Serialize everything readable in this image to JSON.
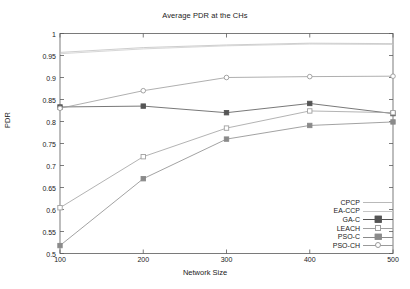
{
  "figure": {
    "title": "Average PDR at the CHs",
    "xlabel": "Network Size",
    "ylabel": "PDR"
  },
  "axes": {
    "y_ticks": [
      "1",
      "0.95",
      "0.9",
      "0.85",
      "0.8",
      "0.75",
      "0.7",
      "0.65",
      "0.6",
      "0.55",
      "0.5"
    ],
    "x_ticks": [
      "100",
      "200",
      "300",
      "400",
      "500"
    ]
  },
  "legend": {
    "entries": [
      {
        "label": "CPCP",
        "marker": "none",
        "color": "#b9b9b9"
      },
      {
        "label": "EA-CCP",
        "marker": "none",
        "color": "#c6c6c6"
      },
      {
        "label": "GA-C",
        "marker": "filled-square",
        "color": "#555555"
      },
      {
        "label": "LEACH",
        "marker": "open-square",
        "color": "#a0a0a0"
      },
      {
        "label": "PSO-C",
        "marker": "filled-square",
        "color": "#8a8a8a"
      },
      {
        "label": "PSO-CH",
        "marker": "open-circle",
        "color": "#9a9a9a"
      }
    ]
  },
  "chart_data": {
    "type": "line",
    "title": "Average PDR at the CHs",
    "xlabel": "Network Size",
    "ylabel": "PDR",
    "x": [
      100,
      200,
      300,
      400,
      500
    ],
    "xlim": [
      100,
      500
    ],
    "ylim": [
      0.5,
      1
    ],
    "ytick_step": 0.05,
    "grid": false,
    "legend_position": "bottom-right inside",
    "series": [
      {
        "name": "CPCP",
        "marker": "none",
        "color": "#b9b9b9",
        "values": [
          0.957,
          0.968,
          0.974,
          0.978,
          0.977
        ]
      },
      {
        "name": "EA-CCP",
        "marker": "none",
        "color": "#c6c6c6",
        "values": [
          0.954,
          0.965,
          0.972,
          0.976,
          0.975
        ]
      },
      {
        "name": "GA-C",
        "marker": "filled-square",
        "color": "#555555",
        "values": [
          0.833,
          0.835,
          0.82,
          0.841,
          0.818
        ]
      },
      {
        "name": "LEACH",
        "marker": "open-square",
        "color": "#a0a0a0",
        "values": [
          0.604,
          0.72,
          0.785,
          0.824,
          0.82
        ]
      },
      {
        "name": "PSO-C",
        "marker": "filled-square",
        "color": "#8a8a8a",
        "values": [
          0.518,
          0.67,
          0.76,
          0.791,
          0.799
        ]
      },
      {
        "name": "PSO-CH",
        "marker": "open-circle",
        "color": "#9a9a9a",
        "values": [
          0.83,
          0.87,
          0.9,
          0.902,
          0.903
        ]
      }
    ]
  }
}
